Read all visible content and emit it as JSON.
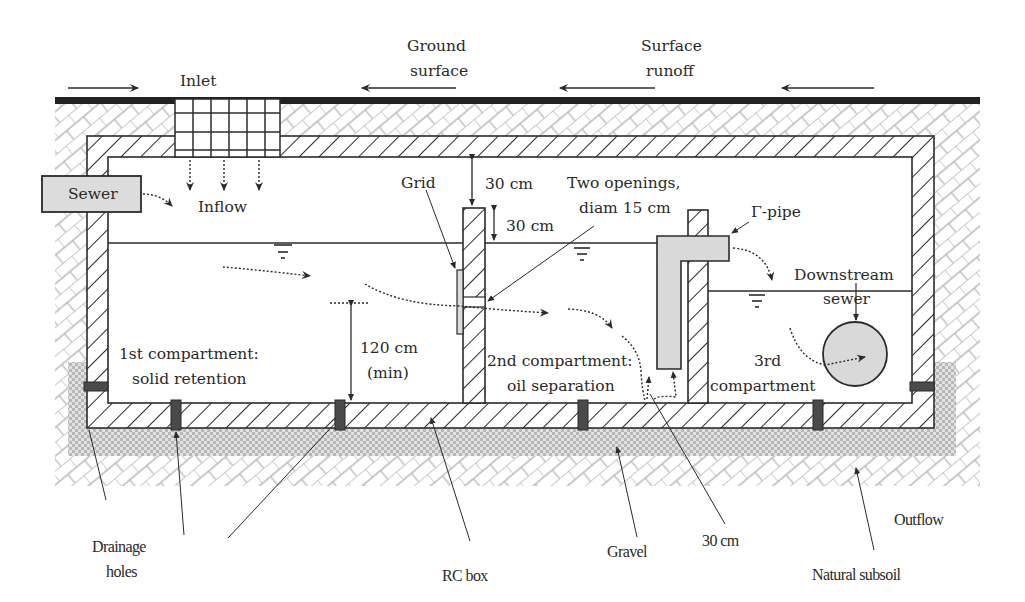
{
  "diagram": {
    "type": "cross-section",
    "top_labels": {
      "inlet": "Inlet",
      "ground_surface_1": "Ground",
      "ground_surface_2": "surface",
      "surface_runoff_1": "Surface",
      "surface_runoff_2": "runoff"
    },
    "inside_labels": {
      "sewer": "Sewer",
      "inflow": "Inflow",
      "grid": "Grid",
      "clearance_top": "30 cm",
      "freeboard": "30 cm",
      "openings_1": "Two openings,",
      "openings_2": "diam 15 cm",
      "gamma_pipe": "Γ-pipe",
      "downstream_1": "Downstream",
      "downstream_2": "sewer",
      "depth_1": "120 cm",
      "depth_2": "(min)",
      "comp1_1": "1st compartment:",
      "comp1_2": "solid retention",
      "comp2_1": "2nd compartment:",
      "comp2_2": "oil separation",
      "comp3_1": "3rd",
      "comp3_2": "compartment"
    },
    "bottom_labels": {
      "drainage_1": "Drainage",
      "drainage_2": "holes",
      "rc_box": "RC box",
      "gravel": "Gravel",
      "gap": "30 cm",
      "outflow": "Outflow",
      "subsoil": "Natural subsoil"
    },
    "colors": {
      "line": "#2b2b2b",
      "pipe_fill": "#d9d9d9",
      "soil_hatch": "#b5b5b5",
      "gravel": "#c9c9c9",
      "drain_plug": "#4a4a4a"
    }
  }
}
